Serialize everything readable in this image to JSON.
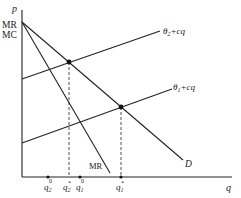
{
  "axes": {
    "y_label": "p",
    "x_label": "q",
    "y_intercept_labels": [
      "MR",
      "MC"
    ]
  },
  "curves": {
    "theta2_line": {
      "label_base": "θ",
      "label_sub": "2",
      "label_rest": "+cq"
    },
    "theta1_line": {
      "label_base": "θ",
      "label_sub": "1",
      "label_rest": "+cq"
    },
    "demand": {
      "label": "D"
    },
    "marginal_revenue": {
      "label": "MR"
    }
  },
  "x_ticks": [
    {
      "base": "q",
      "sub": "2",
      "sup": "0"
    },
    {
      "base": "q",
      "sub": "2",
      "sup": "*"
    },
    {
      "base": "q",
      "sub": "1",
      "sup": "0"
    },
    {
      "base": "q",
      "sub": "1",
      "sup": "*"
    }
  ],
  "colors": {
    "ink": "#222222",
    "background": "#ffffff"
  }
}
